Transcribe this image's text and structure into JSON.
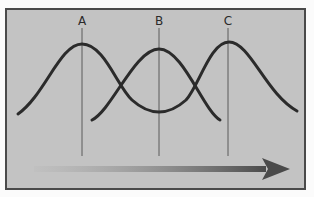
{
  "diagram": {
    "labels": [
      "A",
      "B",
      "C"
    ],
    "colors": {
      "background": "#c3c3c3",
      "frame_border": "#4a4a4a",
      "curve": "#2b2b2b",
      "marker_line": "#5a5a5a",
      "arrow_start": "#bcbcbc",
      "arrow_end": "#4a4a4a"
    },
    "curves": [
      {
        "name": "curve-ac",
        "description": "peaks at A and C, trough at B"
      },
      {
        "name": "curve-b",
        "description": "single peak at B"
      }
    ],
    "arrow": {
      "direction": "right",
      "description": "gradient arrow light to dark"
    }
  }
}
